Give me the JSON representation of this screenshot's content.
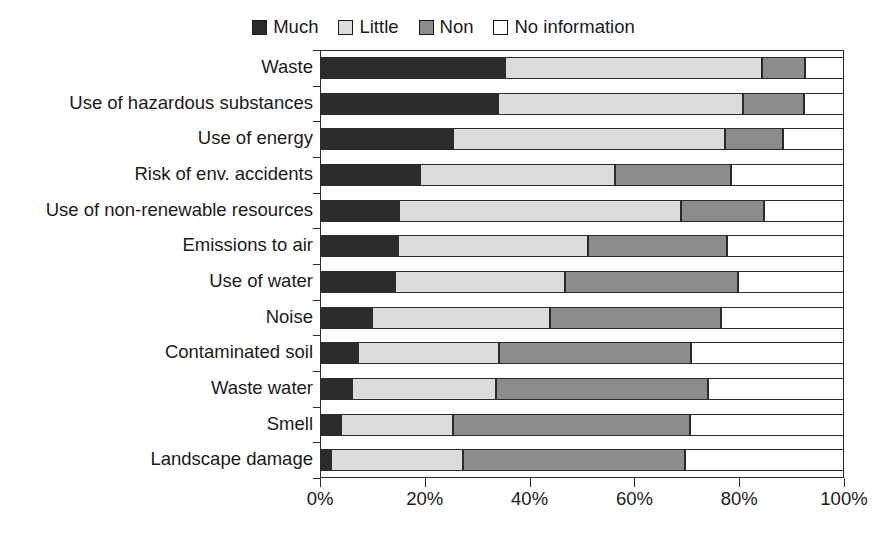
{
  "chart_data": {
    "type": "bar",
    "orientation": "horizontal",
    "stacked": true,
    "normalized_percent": true,
    "title": "",
    "subtitle": "",
    "xlabel": "",
    "ylabel": "",
    "xlim": [
      0,
      100
    ],
    "xticks": [
      0,
      20,
      40,
      60,
      80,
      100
    ],
    "xticklabels": [
      "0%",
      "20%",
      "40%",
      "60%",
      "80%",
      "100%"
    ],
    "grid": false,
    "legend_position": "top-center",
    "legend": [
      "Much",
      "Little",
      "Non",
      "No information"
    ],
    "colors": {
      "Much": "#2b2b2b",
      "Little": "#dcdcdc",
      "Non": "#8c8c8c",
      "No information": "#ffffff",
      "outline": "#2b2b2b",
      "text": "#1a1a1a"
    },
    "categories": [
      "Waste",
      "Use of hazardous substances",
      "Use of energy",
      "Risk of env. accidents",
      "Use of non-renewable resources",
      "Emissions to air",
      "Use of water",
      "Noise",
      "Contaminated soil",
      "Waste water",
      "Smell",
      "Landscape damage"
    ],
    "series": [
      {
        "name": "Much",
        "values": [
          35.3,
          34.0,
          25.4,
          19.1,
          15.1,
          14.9,
          14.3,
          9.9,
          7.3,
          6.1,
          4.0,
          2.1
        ]
      },
      {
        "name": "Little",
        "values": [
          49.1,
          46.8,
          51.9,
          37.2,
          53.8,
          36.2,
          32.5,
          34.0,
          26.9,
          27.5,
          21.4,
          25.2
        ]
      },
      {
        "name": "Non",
        "values": [
          8.2,
          11.5,
          11.1,
          22.1,
          15.8,
          26.6,
          33.0,
          32.6,
          36.6,
          40.5,
          45.2,
          42.4
        ]
      },
      {
        "name": "No information",
        "values": [
          7.4,
          7.7,
          11.6,
          21.6,
          15.3,
          22.3,
          20.2,
          23.5,
          29.2,
          25.9,
          29.4,
          30.3
        ]
      }
    ],
    "cumulative_boundaries": [
      [
        35.3,
        84.4,
        92.6
      ],
      [
        34.0,
        80.8,
        92.3
      ],
      [
        25.4,
        77.3,
        88.4
      ],
      [
        19.1,
        56.3,
        78.4
      ],
      [
        15.1,
        68.9,
        84.7
      ],
      [
        14.9,
        51.1,
        77.7
      ],
      [
        14.3,
        46.8,
        79.8
      ],
      [
        9.9,
        43.9,
        76.5
      ],
      [
        7.3,
        34.2,
        70.8
      ],
      [
        6.1,
        33.6,
        74.1
      ],
      [
        4.0,
        25.4,
        70.6
      ],
      [
        2.1,
        27.3,
        69.7
      ]
    ]
  }
}
